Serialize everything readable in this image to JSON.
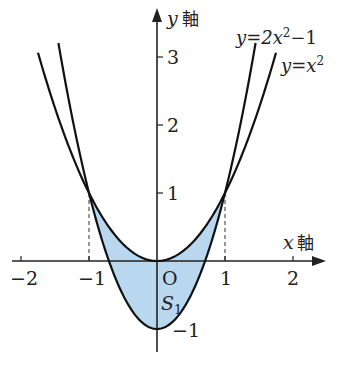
{
  "figure": {
    "type": "function-graph",
    "axes": {
      "x_label": "x 軸",
      "x_var": "x",
      "x_kanji": "軸",
      "y_label": "y 軸",
      "y_var": "y",
      "y_kanji": "軸",
      "origin_label": "O",
      "x_ticks": [
        "−2",
        "−1",
        "1",
        "2"
      ],
      "y_ticks": [
        "3",
        "2",
        "1",
        "−1"
      ]
    },
    "curves": [
      {
        "name": "y=x^2",
        "label_base": "y=x",
        "label_exp": "2",
        "label_tail": ""
      },
      {
        "name": "y=2x^2-1",
        "label_base": "y=2x",
        "label_exp": "2",
        "label_tail": "−1"
      }
    ],
    "region": {
      "label": "S",
      "subscript": "1",
      "fill": "#b9d8f0"
    },
    "colors": {
      "curve": "#111111",
      "axis": "#222222",
      "dashed": "#555555",
      "fill": "#b9d8f0"
    }
  }
}
